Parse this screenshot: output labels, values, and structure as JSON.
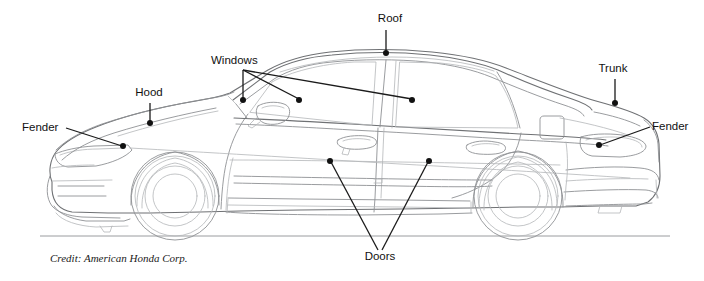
{
  "diagram": {
    "background_color": "#ffffff",
    "outline_color": "#8f9194",
    "leader_color": "#1b1b1b",
    "label_color": "#111111"
  },
  "labels": [
    {
      "id": "roof",
      "text": "Roof",
      "text_x": 390,
      "text_y": 22,
      "anchor": "middle",
      "leaders": [
        {
          "x1": 386,
          "y1": 30,
          "x2": 386,
          "y2": 52
        }
      ],
      "dots": [
        {
          "cx": 386,
          "cy": 53
        }
      ]
    },
    {
      "id": "windows",
      "text": "Windows",
      "text_x": 211,
      "text_y": 64,
      "anchor": "start",
      "leaders": [
        {
          "x1": 243,
          "y1": 70,
          "x2": 243,
          "y2": 99
        },
        {
          "x1": 243,
          "y1": 70,
          "x2": 299,
          "y2": 99
        },
        {
          "x1": 243,
          "y1": 70,
          "x2": 412,
          "y2": 99
        }
      ],
      "dots": [
        {
          "cx": 243,
          "cy": 100
        },
        {
          "cx": 299,
          "cy": 100
        },
        {
          "cx": 412,
          "cy": 100
        }
      ]
    },
    {
      "id": "hood",
      "text": "Hood",
      "text_x": 149,
      "text_y": 96,
      "anchor": "middle",
      "leaders": [
        {
          "x1": 150,
          "y1": 103,
          "x2": 150,
          "y2": 122
        }
      ],
      "dots": [
        {
          "cx": 150,
          "cy": 123
        }
      ]
    },
    {
      "id": "trunk",
      "text": "Trunk",
      "text_x": 613,
      "text_y": 72,
      "anchor": "middle",
      "leaders": [
        {
          "x1": 615,
          "y1": 79,
          "x2": 615,
          "y2": 102
        }
      ],
      "dots": [
        {
          "cx": 615,
          "cy": 103
        }
      ]
    },
    {
      "id": "fender-front",
      "text": "Fender",
      "text_x": 22,
      "text_y": 131,
      "anchor": "start",
      "leaders": [
        {
          "x1": 66,
          "y1": 128,
          "x2": 122,
          "y2": 146
        }
      ],
      "dots": [
        {
          "cx": 123,
          "cy": 146
        }
      ]
    },
    {
      "id": "fender-rear",
      "text": "Fender",
      "text_x": 652,
      "text_y": 130,
      "anchor": "start",
      "leaders": [
        {
          "x1": 650,
          "y1": 127,
          "x2": 600,
          "y2": 145
        }
      ],
      "dots": [
        {
          "cx": 599,
          "cy": 145
        }
      ]
    },
    {
      "id": "doors",
      "text": "Doors",
      "text_x": 380,
      "text_y": 260,
      "anchor": "middle",
      "leaders": [
        {
          "x1": 378,
          "y1": 250,
          "x2": 331,
          "y2": 162
        },
        {
          "x1": 382,
          "y1": 250,
          "x2": 428,
          "y2": 162
        }
      ],
      "dots": [
        {
          "cx": 330,
          "cy": 161
        },
        {
          "cx": 429,
          "cy": 161
        }
      ]
    }
  ],
  "credit": {
    "text": "Credit: American Honda Corp.",
    "x": 50,
    "y": 262
  },
  "wheels": [
    {
      "id": "front-wheel",
      "cx": 175,
      "cy": 196,
      "tire_r": 44,
      "rim_r": 30,
      "hub_r": 22
    },
    {
      "id": "rear-wheel",
      "cx": 518,
      "cy": 196,
      "tire_r": 44,
      "rim_r": 30,
      "hub_r": 22
    }
  ],
  "ground": {
    "x1": 40,
    "y1": 236,
    "x2": 670,
    "y2": 236
  }
}
